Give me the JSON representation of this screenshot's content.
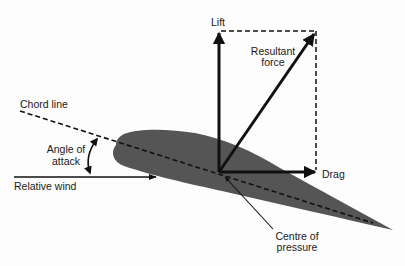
{
  "diagram": {
    "type": "airfoil-forces",
    "labels": {
      "lift": "Lift",
      "resultant_line1": "Resultant",
      "resultant_line2": "force",
      "chord_line": "Chord line",
      "angle_line1": "Angle of",
      "angle_line2": "attack",
      "relative_wind": "Relative wind",
      "drag": "Drag",
      "cop_line1": "Centre of",
      "cop_line2": "pressure"
    },
    "colors": {
      "airfoil": "#555555",
      "lines": "#111111",
      "background": "#fdfdfd"
    },
    "elements": [
      {
        "id": "airfoil",
        "kind": "shape"
      },
      {
        "id": "chord-line",
        "kind": "dashed-line"
      },
      {
        "id": "lift-arrow",
        "kind": "arrow",
        "direction": "up"
      },
      {
        "id": "drag-arrow",
        "kind": "arrow",
        "direction": "right"
      },
      {
        "id": "resultant-arrow",
        "kind": "arrow",
        "direction": "up-right"
      },
      {
        "id": "relative-wind-arrow",
        "kind": "arrow",
        "direction": "right"
      },
      {
        "id": "angle-of-attack-arc",
        "kind": "double-arrow-arc"
      },
      {
        "id": "force-parallelogram",
        "kind": "dashed-lines"
      },
      {
        "id": "centre-of-pressure-pointer",
        "kind": "pointer-line"
      }
    ]
  }
}
